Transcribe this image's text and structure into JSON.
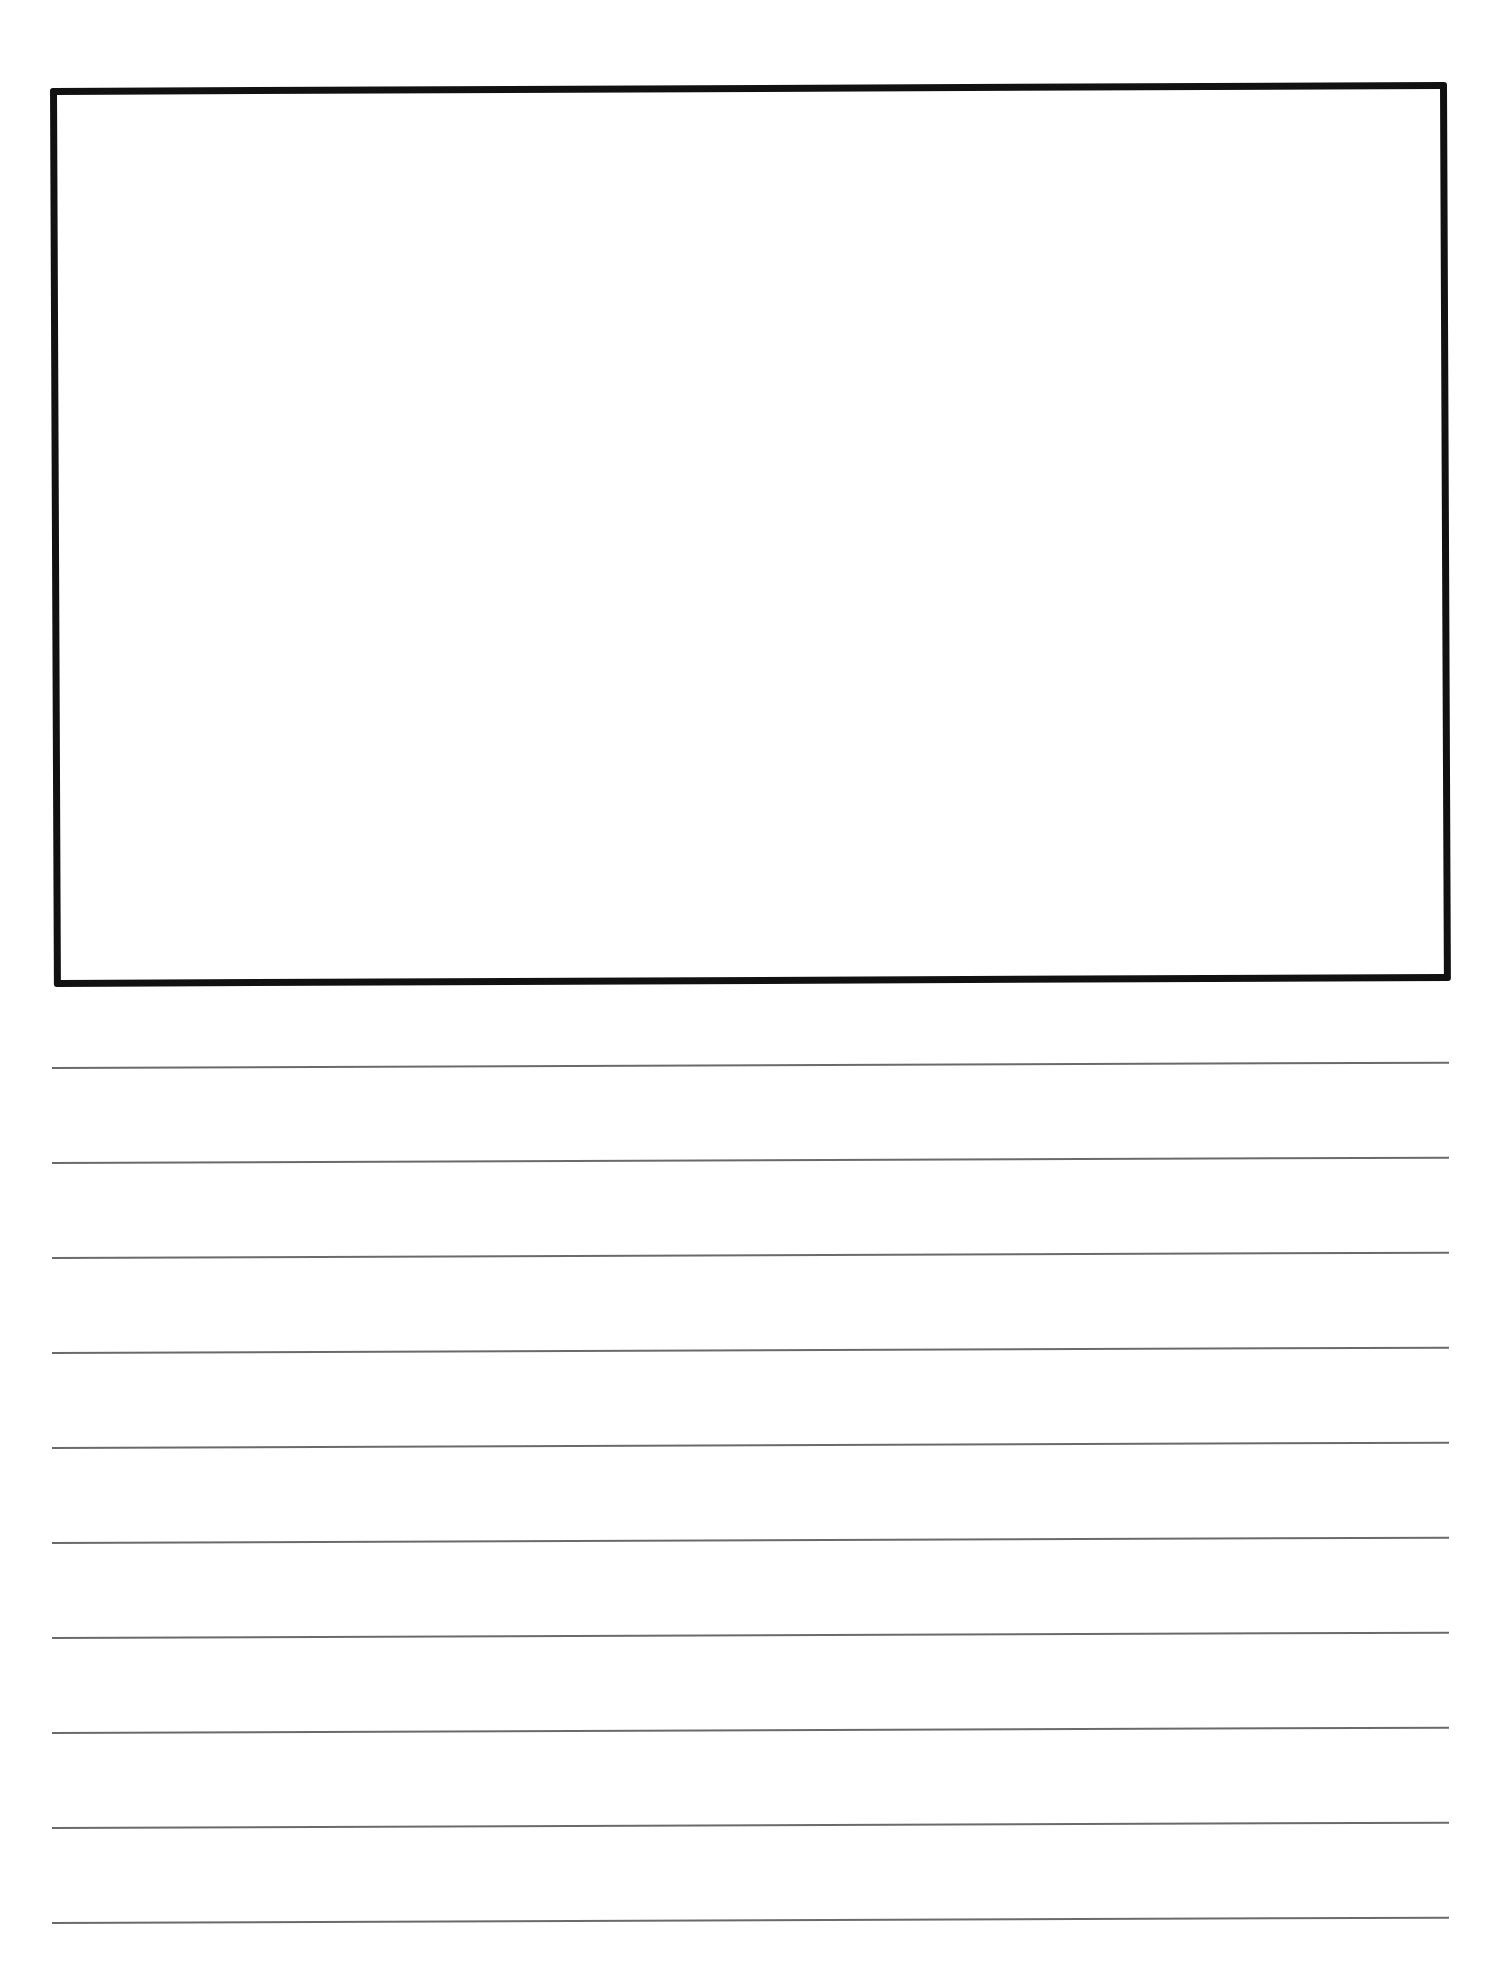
{
  "page": {
    "type": "primary writing paper",
    "drawing_box": {
      "label": ""
    },
    "writing_lines": {
      "count": 10,
      "tops": [
        1067,
        1162,
        1257,
        1352,
        1447,
        1542,
        1637,
        1732,
        1827,
        1922
      ],
      "color": "#6a6a6a"
    },
    "border_color": "#111111"
  }
}
